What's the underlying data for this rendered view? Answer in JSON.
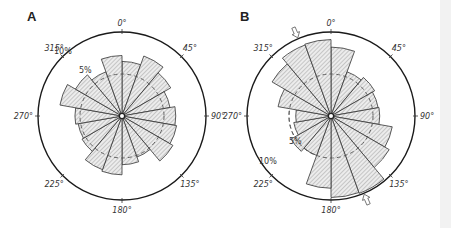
{
  "chart_data": [
    {
      "type": "rose",
      "panel": "A",
      "bin_width_deg": 20,
      "bin_starts_deg": [
        0,
        20,
        40,
        60,
        80,
        100,
        120,
        140,
        160,
        180,
        200,
        220,
        240,
        260,
        280,
        300,
        320,
        340
      ],
      "values_percent": [
        6.5,
        7.6,
        6.7,
        5.8,
        6.4,
        6.6,
        7.0,
        5.2,
        5.8,
        7.0,
        6.8,
        5.5,
        5.3,
        5.6,
        7.5,
        6.4,
        5.6,
        7.2
      ],
      "rings": [
        {
          "value": 5,
          "label": "5%",
          "style": "dashed"
        },
        {
          "value": 10,
          "label": "10%",
          "style": "solid"
        }
      ],
      "angle_labels": [
        "0°",
        "45°",
        "90°",
        "135°",
        "180°",
        "225°",
        "270°",
        "315°"
      ],
      "arrows_deg": []
    },
    {
      "type": "rose",
      "panel": "B",
      "bin_width_deg": 20,
      "bin_starts_deg": [
        0,
        20,
        40,
        60,
        80,
        100,
        120,
        140,
        160,
        180,
        200,
        220,
        240,
        260,
        280,
        300,
        320,
        340
      ],
      "values_percent": [
        8.2,
        5.6,
        6.0,
        5.7,
        5.8,
        7.4,
        8.0,
        9.8,
        9.7,
        8.6,
        5.0,
        5.5,
        4.5,
        4.2,
        6.4,
        8.1,
        9.0,
        9.1
      ],
      "rings": [
        {
          "value": 5,
          "label": "5%",
          "style": "dashed"
        },
        {
          "value": 10,
          "label": "10%",
          "style": "solid"
        }
      ],
      "angle_labels": [
        "0°",
        "45°",
        "90°",
        "135°",
        "180°",
        "225°",
        "270°",
        "315°"
      ],
      "arrows_deg": [
        337,
        157
      ]
    }
  ],
  "panels": [
    {
      "letter": "A"
    },
    {
      "letter": "B"
    }
  ]
}
